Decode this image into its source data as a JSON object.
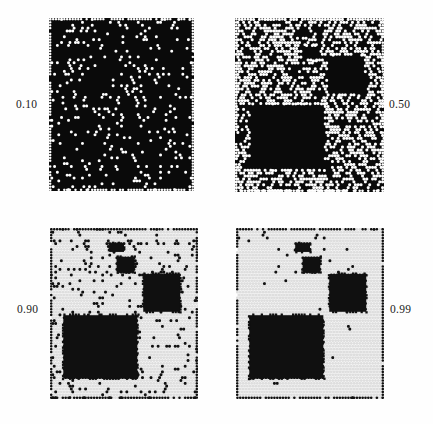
{
  "figure": {
    "title": "",
    "type": "lattice-simulation-grid",
    "background_color": "#fefefe",
    "grid": {
      "rows": 2,
      "cols": 2
    }
  },
  "labels": [
    {
      "id": "label-1",
      "text": "0.10",
      "side": "left",
      "panel": "panel-1"
    },
    {
      "id": "label-2",
      "text": "0.50",
      "side": "right",
      "panel": "panel-2"
    },
    {
      "id": "label-3",
      "text": "0.90",
      "side": "left",
      "panel": "panel-3"
    },
    {
      "id": "label-4",
      "text": "0.99",
      "side": "right",
      "panel": "panel-4"
    }
  ],
  "chart_data": {
    "type": "heatmap",
    "title": "",
    "subtitle": "",
    "xlabel": "",
    "ylabel": "",
    "legend_position": "none",
    "grid": false,
    "panels": [
      {
        "id": "panel-1",
        "label": "0.10",
        "value": 0.1,
        "field_color": "#0a0a0a",
        "dot_color": "#ffffff",
        "dot_density": 0.1,
        "lattice_cols": 52,
        "lattice_rows": 60,
        "dot_radius_px": 2.1,
        "rectangles": []
      },
      {
        "id": "panel-2",
        "label": "0.50",
        "value": 0.5,
        "field_color": "#0a0a0a",
        "dot_color": "#ffffff",
        "dot_density": 0.5,
        "lattice_cols": 52,
        "lattice_rows": 60,
        "dot_radius_px": 2.1,
        "rectangles": [
          {
            "name": "top-patch",
            "x": 0.4,
            "y": 0.06,
            "w": 0.1,
            "h": 0.05
          },
          {
            "name": "mid-patch",
            "x": 0.45,
            "y": 0.16,
            "w": 0.11,
            "h": 0.08
          },
          {
            "name": "right-block",
            "x": 0.62,
            "y": 0.22,
            "w": 0.25,
            "h": 0.22
          },
          {
            "name": "large-block",
            "x": 0.1,
            "y": 0.5,
            "w": 0.5,
            "h": 0.37
          }
        ]
      },
      {
        "id": "panel-3",
        "label": "0.90",
        "value": 0.9,
        "field_color": "#ffffff",
        "dot_color": "#101010",
        "dot_density": 0.1,
        "lattice_cols": 52,
        "lattice_rows": 60,
        "dot_radius_px": 2.1,
        "rectangles": [
          {
            "name": "top-patch",
            "x": 0.4,
            "y": 0.09,
            "w": 0.1,
            "h": 0.05
          },
          {
            "name": "mid-patch",
            "x": 0.45,
            "y": 0.17,
            "w": 0.12,
            "h": 0.09
          },
          {
            "name": "right-block",
            "x": 0.63,
            "y": 0.27,
            "w": 0.25,
            "h": 0.22
          },
          {
            "name": "large-block",
            "x": 0.09,
            "y": 0.51,
            "w": 0.5,
            "h": 0.37
          }
        ]
      },
      {
        "id": "panel-4",
        "label": "0.99",
        "value": 0.99,
        "field_color": "#ffffff",
        "dot_color": "#101010",
        "dot_density": 0.012,
        "lattice_cols": 52,
        "lattice_rows": 60,
        "dot_radius_px": 2.1,
        "rectangles": [
          {
            "name": "top-patch",
            "x": 0.4,
            "y": 0.09,
            "w": 0.1,
            "h": 0.05
          },
          {
            "name": "mid-patch",
            "x": 0.45,
            "y": 0.17,
            "w": 0.12,
            "h": 0.09
          },
          {
            "name": "right-block",
            "x": 0.63,
            "y": 0.27,
            "w": 0.25,
            "h": 0.22
          },
          {
            "name": "large-block",
            "x": 0.09,
            "y": 0.51,
            "w": 0.5,
            "h": 0.37
          }
        ]
      }
    ]
  }
}
